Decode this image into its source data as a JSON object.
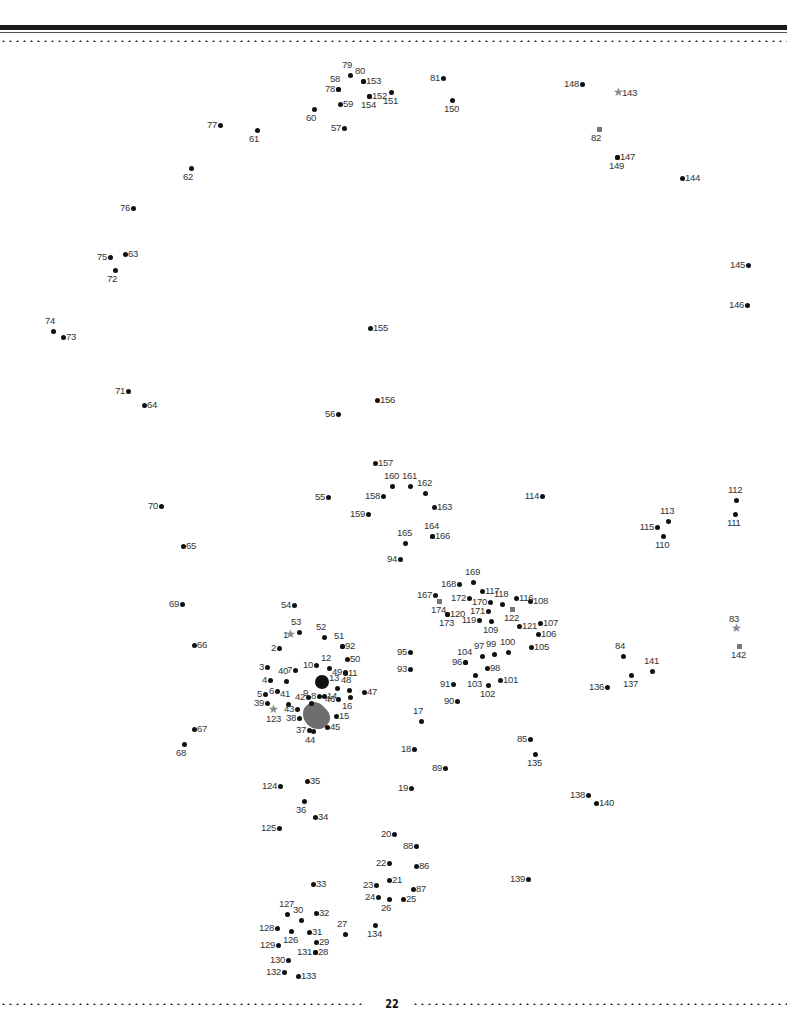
{
  "page": {
    "number": "22"
  },
  "puzzle": {
    "type": "connect-the-dots",
    "start_marker": "star",
    "points": [
      {
        "n": "1",
        "x": 291,
        "y": 635,
        "m": "star",
        "p": "l"
      },
      {
        "n": "2",
        "x": 279,
        "y": 648,
        "p": "l"
      },
      {
        "n": "3",
        "x": 267,
        "y": 667,
        "p": "l"
      },
      {
        "n": "4",
        "x": 270,
        "y": 680,
        "p": "l"
      },
      {
        "n": "5",
        "x": 265,
        "y": 694,
        "p": "l"
      },
      {
        "n": "6",
        "x": 277,
        "y": 691,
        "p": "l"
      },
      {
        "n": "7",
        "x": 295,
        "y": 670,
        "p": "l"
      },
      {
        "n": "8",
        "x": 319,
        "y": 696,
        "p": "l"
      },
      {
        "n": "9",
        "x": 311,
        "y": 703,
        "p": "t"
      },
      {
        "n": "10",
        "x": 316,
        "y": 665,
        "p": "l"
      },
      {
        "n": "11",
        "x": 345,
        "y": 673,
        "p": "r"
      },
      {
        "n": "12",
        "x": 329,
        "y": 668,
        "p": "t"
      },
      {
        "n": "13",
        "x": 337,
        "y": 688,
        "p": "t"
      },
      {
        "n": "14",
        "x": 324,
        "y": 696,
        "p": "r"
      },
      {
        "n": "15",
        "x": 336,
        "y": 716,
        "p": "r"
      },
      {
        "n": "16",
        "x": 350,
        "y": 697,
        "p": "b"
      },
      {
        "n": "17",
        "x": 421,
        "y": 721,
        "p": "t"
      },
      {
        "n": "18",
        "x": 414,
        "y": 749,
        "p": "l"
      },
      {
        "n": "19",
        "x": 411,
        "y": 788,
        "p": "l"
      },
      {
        "n": "20",
        "x": 394,
        "y": 834,
        "p": "l"
      },
      {
        "n": "21",
        "x": 389,
        "y": 880,
        "p": "r"
      },
      {
        "n": "22",
        "x": 389,
        "y": 863,
        "p": "l"
      },
      {
        "n": "23",
        "x": 376,
        "y": 885,
        "p": "l"
      },
      {
        "n": "24",
        "x": 378,
        "y": 897,
        "p": "l"
      },
      {
        "n": "25",
        "x": 403,
        "y": 899,
        "p": "r"
      },
      {
        "n": "26",
        "x": 389,
        "y": 899,
        "p": "b"
      },
      {
        "n": "27",
        "x": 345,
        "y": 934,
        "p": "t"
      },
      {
        "n": "28",
        "x": 315,
        "y": 952,
        "p": "r"
      },
      {
        "n": "29",
        "x": 316,
        "y": 942,
        "p": "r"
      },
      {
        "n": "30",
        "x": 301,
        "y": 920,
        "p": "t"
      },
      {
        "n": "31",
        "x": 309,
        "y": 932,
        "p": "r"
      },
      {
        "n": "32",
        "x": 316,
        "y": 913,
        "p": "r"
      },
      {
        "n": "33",
        "x": 313,
        "y": 884,
        "p": "r"
      },
      {
        "n": "34",
        "x": 315,
        "y": 817,
        "p": "r"
      },
      {
        "n": "35",
        "x": 307,
        "y": 781,
        "p": "r"
      },
      {
        "n": "36",
        "x": 304,
        "y": 801,
        "p": "b"
      },
      {
        "n": "37",
        "x": 309,
        "y": 730,
        "p": "l"
      },
      {
        "n": "38",
        "x": 299,
        "y": 718,
        "p": "l"
      },
      {
        "n": "39",
        "x": 267,
        "y": 703,
        "p": "l"
      },
      {
        "n": "40",
        "x": 286,
        "y": 681,
        "p": "t"
      },
      {
        "n": "41",
        "x": 288,
        "y": 704,
        "p": "t"
      },
      {
        "n": "42",
        "x": 308,
        "y": 697,
        "p": "l"
      },
      {
        "n": "43",
        "x": 297,
        "y": 709,
        "p": "l"
      },
      {
        "n": "44",
        "x": 313,
        "y": 731,
        "p": "b"
      },
      {
        "n": "45",
        "x": 327,
        "y": 727,
        "p": "r"
      },
      {
        "n": "46",
        "x": 338,
        "y": 699,
        "p": "l"
      },
      {
        "n": "47",
        "x": 364,
        "y": 692,
        "p": "r"
      },
      {
        "n": "48",
        "x": 349,
        "y": 690,
        "p": "t"
      },
      {
        "n": "49",
        "x": 345,
        "y": 672,
        "p": "l"
      },
      {
        "n": "50",
        "x": 347,
        "y": 659,
        "p": "r"
      },
      {
        "n": "51",
        "x": 342,
        "y": 646,
        "p": "t"
      },
      {
        "n": "52",
        "x": 324,
        "y": 637,
        "p": "t"
      },
      {
        "n": "53",
        "x": 299,
        "y": 632,
        "p": "t"
      },
      {
        "n": "54",
        "x": 294,
        "y": 605,
        "p": "l"
      },
      {
        "n": "55",
        "x": 328,
        "y": 497,
        "p": "l"
      },
      {
        "n": "56",
        "x": 338,
        "y": 414,
        "p": "l"
      },
      {
        "n": "57",
        "x": 344,
        "y": 128,
        "p": "l"
      },
      {
        "n": "58",
        "x": 338,
        "y": 89,
        "p": "t"
      },
      {
        "n": "59",
        "x": 340,
        "y": 104,
        "p": "r"
      },
      {
        "n": "60",
        "x": 314,
        "y": 109,
        "p": "b"
      },
      {
        "n": "61",
        "x": 257,
        "y": 130,
        "p": "b"
      },
      {
        "n": "62",
        "x": 191,
        "y": 168,
        "p": "b"
      },
      {
        "n": "63",
        "x": 125,
        "y": 254,
        "p": "r"
      },
      {
        "n": "64",
        "x": 144,
        "y": 405,
        "p": "r"
      },
      {
        "n": "65",
        "x": 183,
        "y": 546,
        "p": "r"
      },
      {
        "n": "66",
        "x": 194,
        "y": 645,
        "p": "r"
      },
      {
        "n": "67",
        "x": 194,
        "y": 729,
        "p": "r"
      },
      {
        "n": "68",
        "x": 184,
        "y": 744,
        "p": "b"
      },
      {
        "n": "69",
        "x": 182,
        "y": 604,
        "p": "l"
      },
      {
        "n": "70",
        "x": 161,
        "y": 506,
        "p": "l"
      },
      {
        "n": "71",
        "x": 128,
        "y": 391,
        "p": "l"
      },
      {
        "n": "72",
        "x": 115,
        "y": 270,
        "p": "b"
      },
      {
        "n": "73",
        "x": 63,
        "y": 337,
        "p": "r"
      },
      {
        "n": "74",
        "x": 53,
        "y": 331,
        "p": "t"
      },
      {
        "n": "75",
        "x": 110,
        "y": 257,
        "p": "l"
      },
      {
        "n": "76",
        "x": 133,
        "y": 208,
        "p": "l"
      },
      {
        "n": "77",
        "x": 220,
        "y": 125,
        "p": "l"
      },
      {
        "n": "78",
        "x": 338,
        "y": 89,
        "p": "l"
      },
      {
        "n": "79",
        "x": 350,
        "y": 75,
        "p": "t"
      },
      {
        "n": "80",
        "x": 363,
        "y": 81,
        "p": "t"
      },
      {
        "n": "81",
        "x": 443,
        "y": 78,
        "p": "l"
      },
      {
        "n": "82",
        "x": 599,
        "y": 129,
        "m": "square",
        "p": "b"
      },
      {
        "n": "83",
        "x": 737,
        "y": 629,
        "m": "star",
        "p": "t"
      },
      {
        "n": "84",
        "x": 623,
        "y": 656,
        "p": "t"
      },
      {
        "n": "85",
        "x": 530,
        "y": 739,
        "p": "l"
      },
      {
        "n": "86",
        "x": 416,
        "y": 866,
        "p": "r"
      },
      {
        "n": "87",
        "x": 413,
        "y": 889,
        "p": "r"
      },
      {
        "n": "88",
        "x": 416,
        "y": 846,
        "p": "l"
      },
      {
        "n": "89",
        "x": 445,
        "y": 768,
        "p": "l"
      },
      {
        "n": "90",
        "x": 457,
        "y": 701,
        "p": "l"
      },
      {
        "n": "91",
        "x": 453,
        "y": 684,
        "p": "l"
      },
      {
        "n": "92",
        "x": 342,
        "y": 646,
        "p": "r"
      },
      {
        "n": "93",
        "x": 410,
        "y": 669,
        "p": "l"
      },
      {
        "n": "94",
        "x": 400,
        "y": 559,
        "p": "l"
      },
      {
        "n": "95",
        "x": 410,
        "y": 652,
        "p": "l"
      },
      {
        "n": "96",
        "x": 465,
        "y": 662,
        "p": "l"
      },
      {
        "n": "97",
        "x": 482,
        "y": 656,
        "p": "t"
      },
      {
        "n": "98",
        "x": 487,
        "y": 668,
        "p": "r"
      },
      {
        "n": "99",
        "x": 494,
        "y": 654,
        "p": "t"
      },
      {
        "n": "100",
        "x": 508,
        "y": 652,
        "p": "t"
      },
      {
        "n": "101",
        "x": 500,
        "y": 680,
        "p": "r"
      },
      {
        "n": "102",
        "x": 488,
        "y": 685,
        "p": "b"
      },
      {
        "n": "103",
        "x": 475,
        "y": 675,
        "p": "b"
      },
      {
        "n": "104",
        "x": 465,
        "y": 662,
        "p": "t"
      },
      {
        "n": "105",
        "x": 531,
        "y": 647,
        "p": "r"
      },
      {
        "n": "106",
        "x": 538,
        "y": 634,
        "p": "r"
      },
      {
        "n": "107",
        "x": 540,
        "y": 623,
        "p": "r"
      },
      {
        "n": "108",
        "x": 530,
        "y": 601,
        "p": "r"
      },
      {
        "n": "109",
        "x": 491,
        "y": 621,
        "p": "b"
      },
      {
        "n": "110",
        "x": 663,
        "y": 536,
        "p": "b"
      },
      {
        "n": "111",
        "x": 735,
        "y": 514,
        "p": "b"
      },
      {
        "n": "112",
        "x": 736,
        "y": 500,
        "p": "t"
      },
      {
        "n": "113",
        "x": 668,
        "y": 521,
        "p": "t"
      },
      {
        "n": "114",
        "x": 542,
        "y": 496,
        "p": "l"
      },
      {
        "n": "115",
        "x": 657,
        "y": 527,
        "p": "l"
      },
      {
        "n": "116",
        "x": 516,
        "y": 598,
        "p": "r"
      },
      {
        "n": "117",
        "x": 482,
        "y": 591,
        "p": "r"
      },
      {
        "n": "118",
        "x": 502,
        "y": 604,
        "p": "t"
      },
      {
        "n": "119",
        "x": 479,
        "y": 620,
        "p": "l"
      },
      {
        "n": "120",
        "x": 447,
        "y": 614,
        "p": "r"
      },
      {
        "n": "121",
        "x": 519,
        "y": 626,
        "p": "r"
      },
      {
        "n": "122",
        "x": 512,
        "y": 609,
        "m": "square",
        "p": "b"
      },
      {
        "n": "123",
        "x": 274,
        "y": 710,
        "m": "star",
        "p": "b"
      },
      {
        "n": "124",
        "x": 280,
        "y": 786,
        "p": "l"
      },
      {
        "n": "125",
        "x": 279,
        "y": 828,
        "p": "l"
      },
      {
        "n": "126",
        "x": 291,
        "y": 931,
        "p": "b"
      },
      {
        "n": "127",
        "x": 287,
        "y": 914,
        "p": "t"
      },
      {
        "n": "128",
        "x": 277,
        "y": 928,
        "p": "l"
      },
      {
        "n": "129",
        "x": 278,
        "y": 945,
        "p": "l"
      },
      {
        "n": "130",
        "x": 288,
        "y": 960,
        "p": "l"
      },
      {
        "n": "131",
        "x": 315,
        "y": 952,
        "p": "l"
      },
      {
        "n": "132",
        "x": 284,
        "y": 972,
        "p": "l"
      },
      {
        "n": "133",
        "x": 298,
        "y": 976,
        "p": "r"
      },
      {
        "n": "134",
        "x": 375,
        "y": 925,
        "p": "b"
      },
      {
        "n": "135",
        "x": 535,
        "y": 754,
        "p": "b"
      },
      {
        "n": "136",
        "x": 607,
        "y": 687,
        "p": "l"
      },
      {
        "n": "137",
        "x": 631,
        "y": 675,
        "p": "b"
      },
      {
        "n": "138",
        "x": 588,
        "y": 795,
        "p": "l"
      },
      {
        "n": "139",
        "x": 528,
        "y": 879,
        "p": "l"
      },
      {
        "n": "140",
        "x": 596,
        "y": 803,
        "p": "r"
      },
      {
        "n": "141",
        "x": 652,
        "y": 671,
        "p": "t"
      },
      {
        "n": "142",
        "x": 739,
        "y": 646,
        "m": "square",
        "p": "b"
      },
      {
        "n": "143",
        "x": 619,
        "y": 93,
        "m": "star",
        "p": "r"
      },
      {
        "n": "144",
        "x": 682,
        "y": 178,
        "p": "r"
      },
      {
        "n": "145",
        "x": 748,
        "y": 265,
        "p": "l"
      },
      {
        "n": "146",
        "x": 747,
        "y": 305,
        "p": "l"
      },
      {
        "n": "147",
        "x": 617,
        "y": 157,
        "p": "r"
      },
      {
        "n": "148",
        "x": 582,
        "y": 84,
        "p": "l"
      },
      {
        "n": "149",
        "x": 617,
        "y": 157,
        "p": "b"
      },
      {
        "n": "150",
        "x": 452,
        "y": 100,
        "p": "b"
      },
      {
        "n": "151",
        "x": 391,
        "y": 92,
        "p": "b"
      },
      {
        "n": "152",
        "x": 369,
        "y": 96,
        "p": "r"
      },
      {
        "n": "153",
        "x": 363,
        "y": 81,
        "p": "r"
      },
      {
        "n": "154",
        "x": 369,
        "y": 96,
        "p": "b"
      },
      {
        "n": "155",
        "x": 370,
        "y": 328,
        "p": "r"
      },
      {
        "n": "156",
        "x": 377,
        "y": 400,
        "p": "r"
      },
      {
        "n": "157",
        "x": 375,
        "y": 463,
        "p": "r"
      },
      {
        "n": "158",
        "x": 383,
        "y": 496,
        "p": "l"
      },
      {
        "n": "159",
        "x": 368,
        "y": 514,
        "p": "l"
      },
      {
        "n": "160",
        "x": 392,
        "y": 486,
        "p": "t"
      },
      {
        "n": "161",
        "x": 410,
        "y": 486,
        "p": "t"
      },
      {
        "n": "162",
        "x": 425,
        "y": 493,
        "p": "t"
      },
      {
        "n": "163",
        "x": 434,
        "y": 507,
        "p": "r"
      },
      {
        "n": "164",
        "x": 432,
        "y": 536,
        "p": "t"
      },
      {
        "n": "165",
        "x": 405,
        "y": 543,
        "p": "t"
      },
      {
        "n": "166",
        "x": 432,
        "y": 536,
        "p": "r"
      },
      {
        "n": "167",
        "x": 435,
        "y": 595,
        "p": "l"
      },
      {
        "n": "168",
        "x": 459,
        "y": 584,
        "p": "l"
      },
      {
        "n": "169",
        "x": 473,
        "y": 582,
        "p": "t"
      },
      {
        "n": "170",
        "x": 490,
        "y": 602,
        "p": "l"
      },
      {
        "n": "171",
        "x": 488,
        "y": 611,
        "p": "l"
      },
      {
        "n": "172",
        "x": 469,
        "y": 598,
        "p": "l"
      },
      {
        "n": "173",
        "x": 447,
        "y": 614,
        "p": "b"
      },
      {
        "n": "174",
        "x": 439,
        "y": 601,
        "m": "square",
        "p": "b"
      }
    ]
  },
  "blobs": [
    {
      "name": "eye",
      "x": 322,
      "y": 682,
      "w": 14,
      "h": 14,
      "color": "#111"
    },
    {
      "name": "nose",
      "x": 316,
      "y": 716,
      "w": 28,
      "h": 24,
      "color": "#555"
    }
  ]
}
